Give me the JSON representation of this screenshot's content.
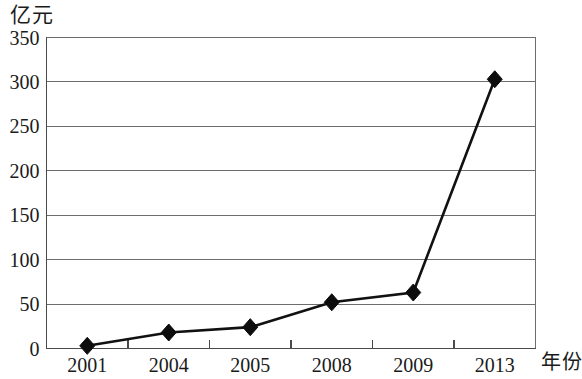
{
  "chart_data": {
    "type": "line",
    "title": "",
    "subtitle": "",
    "xlabel": "年份",
    "ylabel": "亿元",
    "categories": [
      "2001",
      "2004",
      "2005",
      "2008",
      "2009",
      "2013"
    ],
    "values": [
      3,
      18,
      24,
      52,
      63,
      303
    ],
    "series": [
      {
        "name": "亿元",
        "values": [
          3,
          18,
          24,
          52,
          63,
          303
        ]
      }
    ],
    "ylim": [
      0,
      350
    ],
    "ytick_labels": [
      "0",
      "50",
      "100",
      "150",
      "200",
      "250",
      "300",
      "350"
    ],
    "ytick_values": [
      0,
      50,
      100,
      150,
      200,
      250,
      300,
      350
    ],
    "grid": true,
    "grid_axis": "y",
    "legend": false,
    "legend_position": "none",
    "marker": "diamond",
    "line_color": "#111111",
    "marker_color": "#0d0d0d",
    "grid_color": "#6d6d6d",
    "background_color": "#ffffff",
    "annotations": []
  }
}
